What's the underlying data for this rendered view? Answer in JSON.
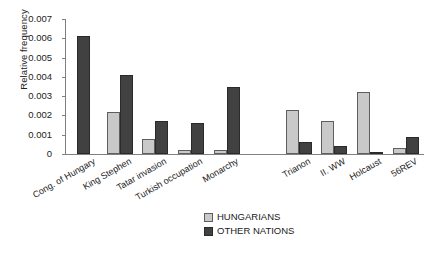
{
  "chart_data": {
    "type": "bar",
    "title": "",
    "xlabel": "",
    "ylabel": "Relative frequency",
    "ylim": [
      0,
      0.007
    ],
    "ytick_labels": [
      "0.007",
      "0.006",
      "0.005",
      "0.004",
      "0.003",
      "0.002",
      "0.001",
      "0"
    ],
    "ytick_values": [
      0.007,
      0.006,
      0.005,
      0.004,
      0.003,
      0.002,
      0.001,
      0
    ],
    "grid": false,
    "legend_position": "bottom-center",
    "categories": [
      "Cong. of Hungary",
      "King Stephen",
      "Tatar invasion",
      "Turkish occupation",
      "Monarchy",
      "",
      "Trianon",
      "II. WW",
      "Holcaust",
      "56REV"
    ],
    "series": [
      {
        "name": "HUNGARIANS",
        "color": "#c9c9c9",
        "values": [
          0.0,
          0.0022,
          0.0008,
          0.0002,
          0.0002,
          0.0,
          0.0023,
          0.0017,
          0.0032,
          0.0003
        ]
      },
      {
        "name": "OTHER NATIONS",
        "color": "#414141",
        "values": [
          0.0061,
          0.0041,
          0.0017,
          0.0016,
          0.0035,
          0.0,
          0.0006,
          0.0004,
          0.0001,
          0.0009
        ]
      }
    ]
  },
  "legend": {
    "items": [
      {
        "label": "HUNGARIANS",
        "swatch": "hun"
      },
      {
        "label": "OTHER NATIONS",
        "swatch": "oth"
      }
    ]
  }
}
